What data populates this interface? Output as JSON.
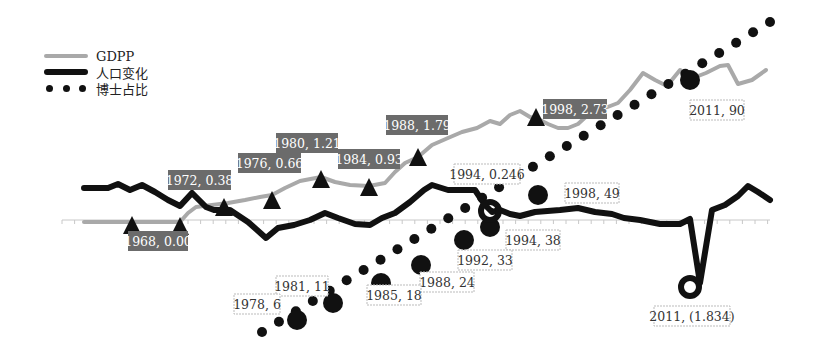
{
  "chart_data": {
    "type": "line",
    "title": "",
    "xlabel": "",
    "ylabel": "",
    "grid": false,
    "legend_position": "top-left",
    "x_range": [
      1960,
      2014
    ],
    "series": [
      {
        "name": "GDPP",
        "style": "solid-gray",
        "color": "#a9a9a9",
        "points": [
          [
            1960,
            0
          ],
          [
            1961,
            0
          ],
          [
            1962,
            0
          ],
          [
            1963,
            0
          ],
          [
            1964,
            0
          ],
          [
            1965,
            0
          ],
          [
            1966,
            0
          ],
          [
            1967,
            0
          ],
          [
            1968,
            0
          ],
          [
            1969,
            0
          ],
          [
            1970,
            0
          ],
          [
            1971,
            0.2
          ],
          [
            1972,
            0.38
          ],
          [
            1973,
            0.45
          ],
          [
            1974,
            0.5
          ],
          [
            1975,
            0.58
          ],
          [
            1976,
            0.66
          ],
          [
            1977,
            0.8
          ],
          [
            1978,
            0.95
          ],
          [
            1979,
            1.1
          ],
          [
            1980,
            1.21
          ],
          [
            1981,
            1.1
          ],
          [
            1982,
            1.0
          ],
          [
            1983,
            0.96
          ],
          [
            1984,
            0.93
          ],
          [
            1985,
            0.95
          ],
          [
            1986,
            1.25
          ],
          [
            1987,
            1.55
          ],
          [
            1988,
            1.79
          ],
          [
            1989,
            2.05
          ],
          [
            1990,
            2.3
          ],
          [
            1991,
            2.2
          ],
          [
            1992,
            2.45
          ],
          [
            1993,
            2.75
          ],
          [
            1994,
            2.6
          ],
          [
            1995,
            2.95
          ],
          [
            1996,
            2.85
          ],
          [
            1997,
            2.6
          ],
          [
            1998,
            2.73
          ],
          [
            1999,
            2.5
          ],
          [
            2000,
            2.45
          ],
          [
            2001,
            2.55
          ],
          [
            2002,
            2.9
          ],
          [
            2003,
            3.1
          ],
          [
            2004,
            3.2
          ],
          [
            2005,
            3.5
          ],
          [
            2006,
            3.9
          ],
          [
            2007,
            3.7
          ],
          [
            2008,
            3.7
          ],
          [
            2009,
            4.0
          ],
          [
            2010,
            3.8
          ],
          [
            2011,
            3.95
          ],
          [
            2012,
            4.05
          ],
          [
            2013,
            3.6
          ],
          [
            2014,
            3.85
          ]
        ]
      },
      {
        "name": "人口变化",
        "style": "solid-black-thick",
        "color": "#111111",
        "points": [
          [
            1960,
            0.95
          ],
          [
            1961,
            0.95
          ],
          [
            1962,
            0.95
          ],
          [
            1963,
            1.05
          ],
          [
            1964,
            0.92
          ],
          [
            1965,
            1.05
          ],
          [
            1966,
            0.95
          ],
          [
            1967,
            0.75
          ],
          [
            1968,
            0.55
          ],
          [
            1969,
            0.45
          ],
          [
            1970,
            0.85
          ],
          [
            1971,
            0.45
          ],
          [
            1972,
            0.2
          ],
          [
            1973,
            0.25
          ],
          [
            1974,
            0.05
          ],
          [
            1975,
            -0.3
          ],
          [
            1976,
            -0.6
          ],
          [
            1977,
            -0.25
          ],
          [
            1978,
            -0.2
          ],
          [
            1979,
            0.0
          ],
          [
            1980,
            0.2
          ],
          [
            1981,
            0.0
          ],
          [
            1982,
            -0.2
          ],
          [
            1983,
            -0.3
          ],
          [
            1984,
            -0.3
          ],
          [
            1985,
            -0.1
          ],
          [
            1986,
            0.2
          ],
          [
            1987,
            0.5
          ],
          [
            1988,
            0.9
          ],
          [
            1989,
            0.8
          ],
          [
            1990,
            0.8
          ],
          [
            1991,
            0.8
          ],
          [
            1992,
            0.8
          ],
          [
            1993,
            0.5
          ],
          [
            1994,
            0.246
          ],
          [
            1995,
            0.35
          ],
          [
            1996,
            0.25
          ],
          [
            1997,
            0.1
          ],
          [
            1998,
            0.2
          ],
          [
            1999,
            0.2
          ],
          [
            2000,
            0.25
          ],
          [
            2001,
            0.05
          ],
          [
            2002,
            0.05
          ],
          [
            2003,
            0.0
          ],
          [
            2004,
            -0.05
          ],
          [
            2005,
            -0.15
          ],
          [
            2006,
            -0.15
          ],
          [
            2007,
            -0.05
          ],
          [
            2008,
            -0.9
          ],
          [
            2009,
            -1.834
          ],
          [
            2010,
            0.45
          ],
          [
            2011,
            0.6
          ],
          [
            2012,
            0.8
          ],
          [
            2013,
            1.05
          ],
          [
            2014,
            0.85
          ]
        ]
      },
      {
        "name": "博士占比",
        "style": "dotted-black",
        "color": "#111111",
        "points": [
          [
            1976,
            0
          ],
          [
            1978,
            6
          ],
          [
            1981,
            11
          ],
          [
            1985,
            18
          ],
          [
            1988,
            24
          ],
          [
            1992,
            33
          ],
          [
            1994,
            38
          ],
          [
            1998,
            49
          ],
          [
            2011,
            90
          ],
          [
            2014,
            100
          ]
        ]
      }
    ],
    "annotations": [
      {
        "label": "1968, 0.00",
        "series": "GDPP",
        "marker": "triangle",
        "box": "dark"
      },
      {
        "label": "1972, 0.38",
        "series": "GDPP",
        "marker": "triangle",
        "box": "dark"
      },
      {
        "label": "1976, 0.66",
        "series": "GDPP",
        "marker": "triangle",
        "box": "dark"
      },
      {
        "label": "1980, 1.21",
        "series": "GDPP",
        "marker": "triangle",
        "box": "dark"
      },
      {
        "label": "1984, 0.93",
        "series": "GDPP",
        "marker": "triangle",
        "box": "dark"
      },
      {
        "label": "1988, 1.79",
        "series": "GDPP",
        "marker": "triangle",
        "box": "dark"
      },
      {
        "label": "1998, 2.73",
        "series": "GDPP",
        "marker": "triangle",
        "box": "dark"
      },
      {
        "label": "1994, 0.246",
        "series": "人口变化",
        "marker": "ring",
        "box": "light"
      },
      {
        "label": "2011, (1.834)",
        "series": "人口变化",
        "marker": "ring",
        "box": "light"
      },
      {
        "label": "1978, 6",
        "series": "博士占比",
        "marker": "circle",
        "box": "light"
      },
      {
        "label": "1981, 11",
        "series": "博士占比",
        "marker": "circle",
        "box": "light"
      },
      {
        "label": "1985, 18",
        "series": "博士占比",
        "marker": "circle",
        "box": "light"
      },
      {
        "label": "1988, 24",
        "series": "博士占比",
        "marker": "circle",
        "box": "light"
      },
      {
        "label": "1992, 33",
        "series": "博士占比",
        "marker": "circle",
        "box": "light"
      },
      {
        "label": "1994, 38",
        "series": "博士占比",
        "marker": "circle",
        "box": "light"
      },
      {
        "label": "1998, 49",
        "series": "博士占比",
        "marker": "circle",
        "box": "light"
      },
      {
        "label": "2011, 90",
        "series": "博士占比",
        "marker": "circle",
        "box": "light"
      }
    ]
  },
  "legend": {
    "items": [
      {
        "label": "GDPP"
      },
      {
        "label": "人口变化"
      },
      {
        "label": "博士占比"
      }
    ]
  },
  "render": {
    "gdpp_path": [
      [
        84,
        222
      ],
      [
        100,
        222
      ],
      [
        116,
        222
      ],
      [
        132,
        222
      ],
      [
        148,
        222
      ],
      [
        164,
        222
      ],
      [
        180,
        222
      ],
      [
        188,
        213
      ],
      [
        196,
        207
      ],
      [
        212,
        205
      ],
      [
        228,
        203
      ],
      [
        245,
        200
      ],
      [
        260,
        197
      ],
      [
        272,
        195
      ],
      [
        285,
        188
      ],
      [
        300,
        181
      ],
      [
        321,
        177
      ],
      [
        335,
        182
      ],
      [
        350,
        185
      ],
      [
        369,
        186
      ],
      [
        385,
        183
      ],
      [
        395,
        172
      ],
      [
        405,
        163
      ],
      [
        418,
        157
      ],
      [
        432,
        145
      ],
      [
        448,
        138
      ],
      [
        462,
        132
      ],
      [
        477,
        128
      ],
      [
        490,
        121
      ],
      [
        500,
        124
      ],
      [
        510,
        115
      ],
      [
        520,
        111
      ],
      [
        530,
        117
      ],
      [
        540,
        120
      ],
      [
        548,
        124
      ],
      [
        558,
        128
      ],
      [
        568,
        128
      ],
      [
        578,
        124
      ],
      [
        590,
        113
      ],
      [
        605,
        108
      ],
      [
        618,
        103
      ],
      [
        630,
        90
      ],
      [
        643,
        73
      ],
      [
        655,
        80
      ],
      [
        667,
        86
      ],
      [
        680,
        70
      ],
      [
        693,
        78
      ],
      [
        706,
        73
      ],
      [
        720,
        66
      ],
      [
        728,
        65
      ],
      [
        738,
        84
      ],
      [
        752,
        80
      ],
      [
        766,
        70
      ]
    ],
    "pop_path": [
      [
        84,
        188
      ],
      [
        96,
        188
      ],
      [
        108,
        188
      ],
      [
        118,
        184
      ],
      [
        130,
        190
      ],
      [
        142,
        185
      ],
      [
        155,
        192
      ],
      [
        168,
        200
      ],
      [
        180,
        206
      ],
      [
        192,
        193
      ],
      [
        206,
        207
      ],
      [
        214,
        210
      ],
      [
        230,
        210
      ],
      [
        248,
        222
      ],
      [
        266,
        238
      ],
      [
        278,
        228
      ],
      [
        294,
        225
      ],
      [
        310,
        220
      ],
      [
        325,
        213
      ],
      [
        338,
        218
      ],
      [
        355,
        224
      ],
      [
        370,
        225
      ],
      [
        382,
        218
      ],
      [
        395,
        213
      ],
      [
        410,
        202
      ],
      [
        424,
        190
      ],
      [
        432,
        185
      ],
      [
        448,
        190
      ],
      [
        462,
        190
      ],
      [
        475,
        190
      ],
      [
        485,
        205
      ],
      [
        492,
        212
      ],
      [
        500,
        210
      ],
      [
        510,
        214
      ],
      [
        520,
        216
      ],
      [
        535,
        212
      ],
      [
        560,
        210
      ],
      [
        578,
        208
      ],
      [
        595,
        212
      ],
      [
        612,
        214
      ],
      [
        624,
        218
      ],
      [
        640,
        220
      ],
      [
        660,
        224
      ],
      [
        680,
        224
      ],
      [
        690,
        219
      ],
      [
        700,
        283
      ],
      [
        712,
        210
      ],
      [
        725,
        205
      ],
      [
        738,
        196
      ],
      [
        748,
        186
      ],
      [
        758,
        192
      ],
      [
        770,
        200
      ]
    ],
    "dot_path": [
      [
        262,
        332
      ],
      [
        770,
        22
      ]
    ],
    "triangles": [
      [
        132,
        225
      ],
      [
        180,
        226
      ],
      [
        224,
        207
      ],
      [
        272,
        200
      ],
      [
        321,
        179
      ],
      [
        369,
        187
      ],
      [
        418,
        157
      ],
      [
        536,
        117
      ]
    ],
    "dark_boxes": [
      {
        "x": 128,
        "y": 231,
        "w": 60,
        "h": 20,
        "text": "1968, 0.00"
      },
      {
        "x": 168,
        "y": 170,
        "w": 63,
        "h": 20,
        "text": "1972, 0.38"
      },
      {
        "x": 238,
        "y": 153,
        "w": 63,
        "h": 20,
        "text": "1976, 0.66"
      },
      {
        "x": 276,
        "y": 133,
        "w": 62,
        "h": 20,
        "text": "1980, 1.21"
      },
      {
        "x": 338,
        "y": 149,
        "w": 62,
        "h": 20,
        "text": "1984, 0.93"
      },
      {
        "x": 386,
        "y": 115,
        "w": 62,
        "h": 20,
        "text": "1988, 1.79"
      },
      {
        "x": 543,
        "y": 99,
        "w": 64,
        "h": 20,
        "text": "1998, 2.73"
      }
    ],
    "light_boxes": [
      {
        "x": 454,
        "y": 164,
        "w": 66,
        "h": 20,
        "text": "1994, 0.246"
      },
      {
        "x": 506,
        "y": 230,
        "w": 54,
        "h": 20,
        "text": "1994, 38"
      },
      {
        "x": 458,
        "y": 250,
        "w": 54,
        "h": 20,
        "text": "1992, 33"
      },
      {
        "x": 420,
        "y": 272,
        "w": 54,
        "h": 20,
        "text": "1988, 24"
      },
      {
        "x": 367,
        "y": 285,
        "w": 54,
        "h": 20,
        "text": "1985, 18"
      },
      {
        "x": 276,
        "y": 276,
        "w": 52,
        "h": 20,
        "text": "1981, 11"
      },
      {
        "x": 234,
        "y": 294,
        "w": 46,
        "h": 20,
        "text": "1978, 6"
      },
      {
        "x": 565,
        "y": 183,
        "w": 54,
        "h": 20,
        "text": "1998, 49"
      },
      {
        "x": 690,
        "y": 100,
        "w": 54,
        "h": 20,
        "text": "2011, 90"
      },
      {
        "x": 654,
        "y": 306,
        "w": 76,
        "h": 20,
        "text": "2011, (1.834)"
      }
    ],
    "big_circles": [
      [
        297,
        320
      ],
      [
        333,
        303
      ],
      [
        381,
        283
      ],
      [
        421,
        265
      ],
      [
        464,
        240
      ],
      [
        490,
        227
      ],
      [
        538,
        195
      ],
      [
        690,
        80
      ]
    ],
    "rings": [
      [
        490,
        211
      ],
      [
        690,
        287
      ]
    ]
  }
}
